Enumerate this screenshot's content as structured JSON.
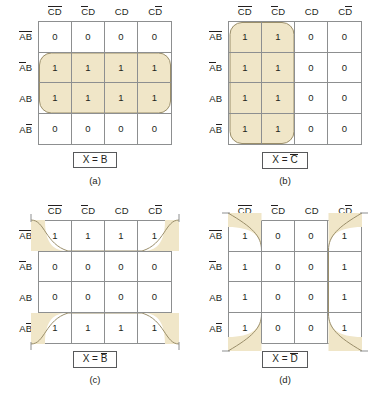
{
  "figure": {
    "highlight_color": "#f0e6c8",
    "group_stroke": "#9a8e6a",
    "grid_line_color": "#8d8f90"
  },
  "maps": [
    {
      "id": "a",
      "caption": "(a)",
      "result": "X = B",
      "result_overbar": "",
      "col_headers": [
        "CD",
        "CD",
        "CD",
        "CD"
      ],
      "row_headers": [
        "AB",
        "AB",
        "AB",
        "AB"
      ],
      "values": [
        [
          "0",
          "0",
          "0",
          "0"
        ],
        [
          "1",
          "1",
          "1",
          "1"
        ],
        [
          "1",
          "1",
          "1",
          "1"
        ],
        [
          "0",
          "0",
          "0",
          "0"
        ]
      ]
    },
    {
      "id": "b",
      "caption": "(b)",
      "result": "X = C",
      "result_overbar": "C",
      "col_headers": [
        "CD",
        "CD",
        "CD",
        "CD"
      ],
      "row_headers": [
        "AB",
        "AB",
        "AB",
        "AB"
      ],
      "values": [
        [
          "1",
          "1",
          "0",
          "0"
        ],
        [
          "1",
          "1",
          "0",
          "0"
        ],
        [
          "1",
          "1",
          "0",
          "0"
        ],
        [
          "1",
          "1",
          "0",
          "0"
        ]
      ]
    },
    {
      "id": "c",
      "caption": "(c)",
      "result": "X = B",
      "result_overbar": "B",
      "col_headers": [
        "CD",
        "CD",
        "CD",
        "CD"
      ],
      "row_headers": [
        "AB",
        "AB",
        "AB",
        "AB"
      ],
      "values": [
        [
          "1",
          "1",
          "1",
          "1"
        ],
        [
          "0",
          "0",
          "0",
          "0"
        ],
        [
          "0",
          "0",
          "0",
          "0"
        ],
        [
          "1",
          "1",
          "1",
          "1"
        ]
      ]
    },
    {
      "id": "d",
      "caption": "(d)",
      "result": "X = D",
      "result_overbar": "D",
      "col_headers": [
        "CD",
        "CD",
        "CD",
        "CD"
      ],
      "row_headers": [
        "AB",
        "AB",
        "AB",
        "AB"
      ],
      "values": [
        [
          "1",
          "0",
          "0",
          "1"
        ],
        [
          "1",
          "0",
          "0",
          "1"
        ],
        [
          "1",
          "0",
          "0",
          "1"
        ],
        [
          "1",
          "0",
          "0",
          "1"
        ]
      ]
    }
  ]
}
